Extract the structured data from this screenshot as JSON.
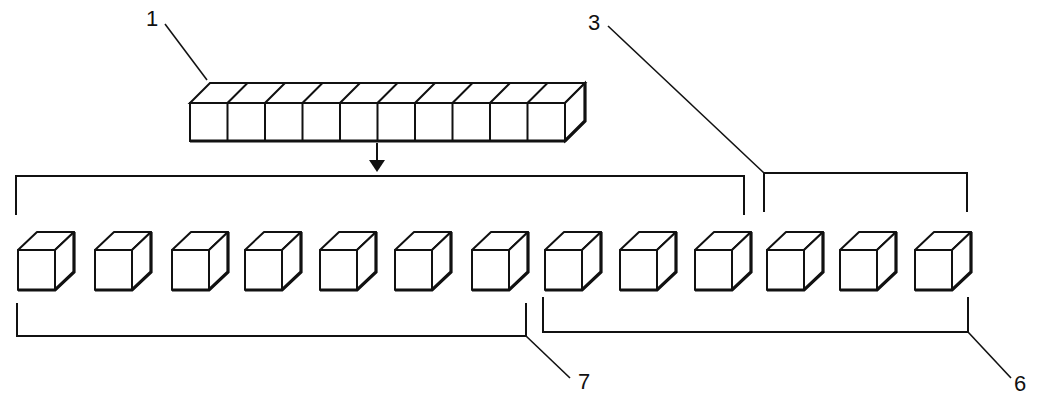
{
  "diagram": {
    "colors": {
      "stroke": "#111111",
      "background": "#ffffff"
    },
    "rod": {
      "cube_count": 10,
      "x": 190,
      "y": 103,
      "face_w": 37.5,
      "face_h": 38,
      "dx": 20,
      "dy": -20
    },
    "arrow": {
      "x": 377,
      "y1": 143,
      "y2": 172
    },
    "cubes": {
      "count": 13,
      "y": 250,
      "face_w": 37,
      "face_h": 40,
      "dx": 19,
      "dy": -18,
      "x": [
        18,
        95,
        172,
        245,
        320,
        395,
        472,
        545,
        620,
        695,
        767,
        840,
        915
      ]
    },
    "brackets": [
      {
        "id": "top-ten",
        "side": "top",
        "x1": 16,
        "x2": 744,
        "y": 176,
        "tick_to": 215
      },
      {
        "id": "top-three",
        "side": "top",
        "x1": 764,
        "x2": 967,
        "y": 173,
        "tick_to": 212
      },
      {
        "id": "bottom-seven",
        "side": "bottom",
        "x1": 17,
        "x2": 526,
        "y": 336,
        "tick_to": 303
      },
      {
        "id": "bottom-six",
        "side": "bottom",
        "x1": 543,
        "x2": 968,
        "y": 332,
        "tick_to": 297
      }
    ],
    "labels": [
      {
        "text": "1",
        "x": 146,
        "y": 8,
        "leader": [
          207,
          80,
          165,
          24
        ]
      },
      {
        "text": "3",
        "x": 588,
        "y": 12,
        "leader": [
          764,
          173,
          608,
          26
        ]
      },
      {
        "text": "7",
        "x": 578,
        "y": 371,
        "leader": [
          526,
          336,
          570,
          378
        ]
      },
      {
        "text": "6",
        "x": 1014,
        "y": 373,
        "leader": [
          968,
          332,
          1011,
          378
        ]
      }
    ]
  }
}
